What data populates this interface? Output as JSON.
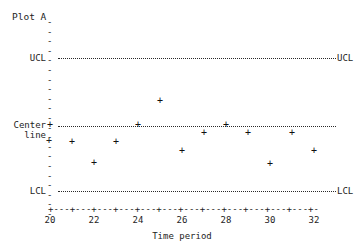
{
  "chart_data": {
    "type": "scatter",
    "title": "Plot A",
    "xlabel": "Time period",
    "ylabel": "",
    "xlim": [
      19.5,
      32.6
    ],
    "ylim": [
      0,
      1
    ],
    "grid": false,
    "legend_position": "none",
    "x": [
      20,
      21,
      22,
      23,
      24,
      25,
      26,
      27,
      28,
      29,
      30,
      31,
      32
    ],
    "values": [
      0.5,
      0.38,
      0.24,
      0.38,
      0.5,
      0.66,
      0.32,
      0.44,
      0.5,
      0.44,
      0.23,
      0.44,
      0.32
    ],
    "xticks": [
      20,
      21,
      22,
      23,
      24,
      25,
      26,
      27,
      28,
      29,
      30,
      31,
      32
    ],
    "xticklabels": [
      "20",
      "",
      "22",
      "",
      "24",
      "",
      "26",
      "",
      "28",
      "",
      "30",
      "",
      "32"
    ],
    "reference_lines": [
      {
        "name": "UCL",
        "label_left": "UCL",
        "label_right": "UCL",
        "value": 0.95
      },
      {
        "name": "Center line",
        "label_left": "Center\nline",
        "label_right": "",
        "value": 0.5
      },
      {
        "name": "LCL",
        "label_left": "LCL",
        "label_right": "LCL",
        "value": 0.05
      }
    ],
    "marker": "+",
    "annotations": []
  },
  "labels": {
    "title": "Plot A",
    "ucl_left": "UCL",
    "ucl_right": "UCL",
    "center_left": "Center",
    "center_left_2": "line",
    "lcl_left": "LCL",
    "lcl_right": "LCL",
    "xaxis_title": "Time period",
    "x_20": "20",
    "x_22": "22",
    "x_24": "24",
    "x_26": "26",
    "x_28": "28",
    "x_30": "30",
    "x_32": "32",
    "xaxis_tickstring": "+---+---+---+---+---+---+---+---+---+---+---+---+-",
    "marker": "+",
    "ytick_dash": "-"
  },
  "colors": {
    "background": "#ffffff",
    "ink": "#1d1d1d",
    "line": "#2a2a2a"
  }
}
